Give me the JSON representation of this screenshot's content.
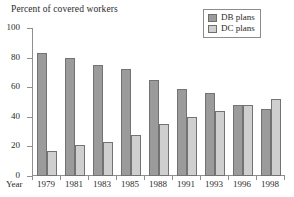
{
  "chart_data": {
    "type": "bar",
    "title": "Percent of covered workers",
    "xlabel": "Year",
    "ylabel": "",
    "ylim": [
      0,
      100
    ],
    "yticks": [
      0,
      20,
      40,
      60,
      80,
      100
    ],
    "grid": false,
    "legend_position": "top-right",
    "categories": [
      "1979",
      "1981",
      "1983",
      "1985",
      "1988",
      "1991",
      "1993",
      "1996",
      "1998"
    ],
    "series": [
      {
        "name": "DB plans",
        "color": "#9b9b9b",
        "values": [
          83,
          80,
          75,
          72,
          65,
          59,
          56,
          48,
          45
        ]
      },
      {
        "name": "DC plans",
        "color": "#cfcfcf",
        "values": [
          17,
          21,
          23,
          28,
          35,
          40,
          44,
          48,
          52
        ]
      }
    ]
  },
  "legend": {
    "items": [
      {
        "label": "DB plans",
        "swatch_color": "#9b9b9b"
      },
      {
        "label": "DC plans",
        "swatch_color": "#cfcfcf"
      }
    ]
  },
  "axis": {
    "y_tick_labels": [
      "100",
      "80",
      "60",
      "40",
      "20",
      "0"
    ],
    "x_axis_name": "Year"
  }
}
